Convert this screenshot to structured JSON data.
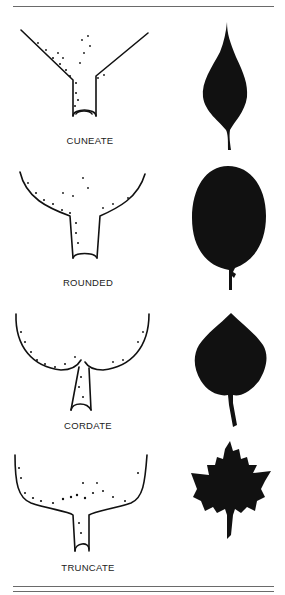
{
  "figure": {
    "rows": [
      {
        "label": "CUNEATE",
        "base_shape": "cuneate",
        "silhouette": "lanceolate-leaf"
      },
      {
        "label": "ROUNDED",
        "base_shape": "rounded",
        "silhouette": "oval-leaf"
      },
      {
        "label": "CORDATE",
        "base_shape": "cordate",
        "silhouette": "heart-leaf"
      },
      {
        "label": "TRUNCATE",
        "base_shape": "truncate",
        "silhouette": "maple-leaf"
      }
    ]
  },
  "colors": {
    "ink": "#111111",
    "rule": "#6a6a6a",
    "background": "#ffffff"
  }
}
